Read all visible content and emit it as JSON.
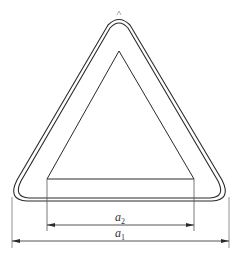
{
  "diagram": {
    "colors": {
      "stroke": "#2a2a2a",
      "extension_line": "#555555",
      "background": "#ffffff",
      "apex_mark": "#999999"
    },
    "shapes": {
      "outer_border": "rounded triangle (outer edge)",
      "inner_border": "rounded triangle (inner edge of rim)",
      "inner_triangle": "plain triangle (symbol field)"
    },
    "dimensions": [
      {
        "id": "a2",
        "label": "a",
        "subscript": "2",
        "description": "width of inner triangle base"
      },
      {
        "id": "a1",
        "label": "a",
        "subscript": "1",
        "description": "overall width of sign"
      }
    ]
  }
}
